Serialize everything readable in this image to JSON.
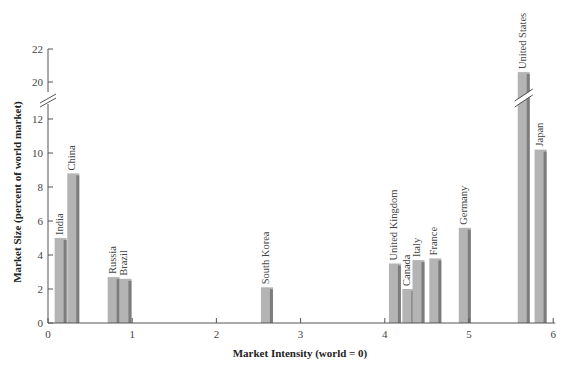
{
  "chart_data": {
    "type": "bar",
    "title": "",
    "xlabel": "Market Intensity (world = 0)",
    "ylabel": "Market Size (percent of world market)",
    "xlim": [
      0,
      6
    ],
    "ylim": [
      0,
      22
    ],
    "y_axis_break": [
      12.5,
      19.5
    ],
    "x_ticks": [
      0,
      1,
      2,
      3,
      4,
      5,
      6
    ],
    "y_ticks": [
      0,
      2,
      4,
      6,
      8,
      10,
      12,
      20,
      22
    ],
    "grid": false,
    "legend": null,
    "series": [
      {
        "name": "Market Size",
        "points": [
          {
            "label": "India",
            "x": 0.15,
            "y": 5.0
          },
          {
            "label": "China",
            "x": 0.3,
            "y": 8.8
          },
          {
            "label": "Russia",
            "x": 0.78,
            "y": 2.7
          },
          {
            "label": "Brazil",
            "x": 0.92,
            "y": 2.6
          },
          {
            "label": "South Korea",
            "x": 2.6,
            "y": 2.1
          },
          {
            "label": "United Kingdom",
            "x": 4.12,
            "y": 3.5
          },
          {
            "label": "Canada",
            "x": 4.28,
            "y": 2.0
          },
          {
            "label": "Italy",
            "x": 4.4,
            "y": 3.7
          },
          {
            "label": "France",
            "x": 4.6,
            "y": 3.8
          },
          {
            "label": "Germany",
            "x": 4.95,
            "y": 5.6
          },
          {
            "label": "United States",
            "x": 5.65,
            "y": 20.6
          },
          {
            "label": "Japan",
            "x": 5.85,
            "y": 10.2
          }
        ]
      }
    ],
    "colors": {
      "bar": "#b4b4b4",
      "bar_shadow": "#7c7c7c",
      "axis": "#555555"
    }
  }
}
